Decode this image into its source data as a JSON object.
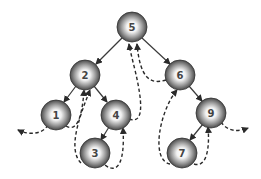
{
  "diagram": {
    "type": "binary-search-tree-traversal",
    "nodes": [
      {
        "id": "n5",
        "label": "5",
        "x": 132,
        "y": 27
      },
      {
        "id": "n2",
        "label": "2",
        "x": 85,
        "y": 75
      },
      {
        "id": "n6",
        "label": "6",
        "x": 180,
        "y": 75
      },
      {
        "id": "n1",
        "label": "1",
        "x": 56,
        "y": 115
      },
      {
        "id": "n4",
        "label": "4",
        "x": 116,
        "y": 115
      },
      {
        "id": "n3",
        "label": "3",
        "x": 95,
        "y": 153
      },
      {
        "id": "n9",
        "label": "9",
        "x": 211,
        "y": 113
      },
      {
        "id": "n7",
        "label": "7",
        "x": 182,
        "y": 153
      }
    ],
    "edges": [
      {
        "from": "5",
        "to": "2"
      },
      {
        "from": "5",
        "to": "6"
      },
      {
        "from": "2",
        "to": "1"
      },
      {
        "from": "2",
        "to": "4"
      },
      {
        "from": "4",
        "to": "3"
      },
      {
        "from": "6",
        "to": "9"
      },
      {
        "from": "9",
        "to": "7"
      }
    ],
    "traversal_style": "dashed arrows"
  }
}
